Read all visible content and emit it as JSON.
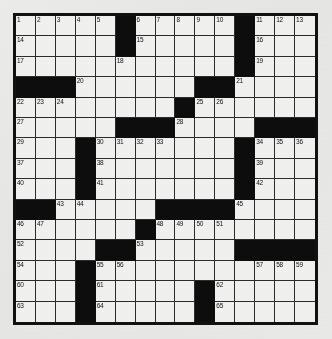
{
  "puzzle": {
    "title": "Crossword Puzzle Grid",
    "grid_size": {
      "rows": 15,
      "cols": 15
    },
    "colors": {
      "block": "#0d0d0d",
      "cell": "#f1f1ef",
      "border": "#111111",
      "page_background": "#e8e8e6",
      "number_text": "#111111"
    },
    "legend": {
      "block_symbol": "#",
      "open_symbol": "."
    },
    "layout_rows": [
      ".....#.....#....",
      ".....#.....#....",
      ".....#.....#....",
      "###...........",
      "........#......",
      ".....###.....###",
      "...#........#...",
      "...#........#...",
      "...#........#...",
      "##.....####....",
      "......#........",
      "....##.......####",
      "...#.........###",
      "...#.....#.....",
      "...#.....#....."
    ],
    "grid": [
      [
        "w",
        "w",
        "w",
        "w",
        "w",
        "b",
        "w",
        "w",
        "w",
        "w",
        "w",
        "b",
        "w",
        "w",
        "w"
      ],
      [
        "w",
        "w",
        "w",
        "w",
        "w",
        "b",
        "w",
        "w",
        "w",
        "w",
        "w",
        "b",
        "w",
        "w",
        "w"
      ],
      [
        "w",
        "w",
        "w",
        "w",
        "w",
        "w",
        "w",
        "w",
        "w",
        "w",
        "w",
        "b",
        "w",
        "w",
        "w"
      ],
      [
        "b",
        "b",
        "b",
        "w",
        "w",
        "w",
        "w",
        "w",
        "w",
        "b",
        "b",
        "w",
        "w",
        "w",
        "w"
      ],
      [
        "w",
        "w",
        "w",
        "w",
        "w",
        "w",
        "w",
        "w",
        "b",
        "w",
        "w",
        "w",
        "w",
        "w",
        "w"
      ],
      [
        "w",
        "w",
        "w",
        "w",
        "w",
        "b",
        "b",
        "b",
        "w",
        "w",
        "w",
        "w",
        "b",
        "b",
        "b"
      ],
      [
        "w",
        "w",
        "w",
        "b",
        "w",
        "w",
        "w",
        "w",
        "w",
        "w",
        "w",
        "b",
        "w",
        "w",
        "w"
      ],
      [
        "w",
        "w",
        "w",
        "b",
        "w",
        "w",
        "w",
        "w",
        "w",
        "w",
        "w",
        "b",
        "w",
        "w",
        "w"
      ],
      [
        "w",
        "w",
        "w",
        "b",
        "w",
        "w",
        "w",
        "w",
        "w",
        "w",
        "w",
        "b",
        "w",
        "w",
        "w"
      ],
      [
        "b",
        "b",
        "w",
        "w",
        "w",
        "w",
        "w",
        "b",
        "b",
        "b",
        "b",
        "w",
        "w",
        "w",
        "w"
      ],
      [
        "w",
        "w",
        "w",
        "w",
        "w",
        "w",
        "b",
        "w",
        "w",
        "w",
        "w",
        "w",
        "w",
        "w",
        "w"
      ],
      [
        "w",
        "w",
        "w",
        "w",
        "b",
        "b",
        "w",
        "w",
        "w",
        "w",
        "w",
        "b",
        "b",
        "b",
        "b"
      ],
      [
        "w",
        "w",
        "w",
        "b",
        "w",
        "w",
        "w",
        "w",
        "w",
        "w",
        "w",
        "w",
        "w",
        "w",
        "w"
      ],
      [
        "w",
        "w",
        "w",
        "b",
        "w",
        "w",
        "w",
        "w",
        "w",
        "b",
        "w",
        "w",
        "w",
        "w",
        "w"
      ],
      [
        "w",
        "w",
        "w",
        "b",
        "w",
        "w",
        "w",
        "w",
        "w",
        "b",
        "w",
        "w",
        "w",
        "w",
        "w"
      ]
    ],
    "numbers": [
      {
        "row": 0,
        "col": 0,
        "n": "1"
      },
      {
        "row": 0,
        "col": 1,
        "n": "2"
      },
      {
        "row": 0,
        "col": 2,
        "n": "3"
      },
      {
        "row": 0,
        "col": 3,
        "n": "4"
      },
      {
        "row": 0,
        "col": 4,
        "n": "5"
      },
      {
        "row": 0,
        "col": 6,
        "n": "6"
      },
      {
        "row": 0,
        "col": 7,
        "n": "7"
      },
      {
        "row": 0,
        "col": 8,
        "n": "8"
      },
      {
        "row": 0,
        "col": 9,
        "n": "9"
      },
      {
        "row": 0,
        "col": 10,
        "n": "10"
      },
      {
        "row": 0,
        "col": 12,
        "n": "11"
      },
      {
        "row": 0,
        "col": 13,
        "n": "12"
      },
      {
        "row": 0,
        "col": 14,
        "n": "13"
      },
      {
        "row": 1,
        "col": 0,
        "n": "14"
      },
      {
        "row": 1,
        "col": 6,
        "n": "15"
      },
      {
        "row": 1,
        "col": 12,
        "n": "16"
      },
      {
        "row": 2,
        "col": 0,
        "n": "17"
      },
      {
        "row": 2,
        "col": 5,
        "n": "18"
      },
      {
        "row": 2,
        "col": 12,
        "n": "19"
      },
      {
        "row": 3,
        "col": 3,
        "n": "20"
      },
      {
        "row": 3,
        "col": 11,
        "n": "21"
      },
      {
        "row": 4,
        "col": 0,
        "n": "22"
      },
      {
        "row": 4,
        "col": 1,
        "n": "23"
      },
      {
        "row": 4,
        "col": 2,
        "n": "24"
      },
      {
        "row": 4,
        "col": 9,
        "n": "25"
      },
      {
        "row": 4,
        "col": 10,
        "n": "26"
      },
      {
        "row": 5,
        "col": 0,
        "n": "27"
      },
      {
        "row": 5,
        "col": 8,
        "n": "28"
      },
      {
        "row": 6,
        "col": 0,
        "n": "29"
      },
      {
        "row": 6,
        "col": 4,
        "n": "30"
      },
      {
        "row": 6,
        "col": 5,
        "n": "31"
      },
      {
        "row": 6,
        "col": 6,
        "n": "32"
      },
      {
        "row": 6,
        "col": 7,
        "n": "33"
      },
      {
        "row": 6,
        "col": 12,
        "n": "34"
      },
      {
        "row": 6,
        "col": 13,
        "n": "35"
      },
      {
        "row": 6,
        "col": 14,
        "n": "36"
      },
      {
        "row": 7,
        "col": 0,
        "n": "37"
      },
      {
        "row": 7,
        "col": 4,
        "n": "38"
      },
      {
        "row": 7,
        "col": 12,
        "n": "39"
      },
      {
        "row": 8,
        "col": 0,
        "n": "40"
      },
      {
        "row": 8,
        "col": 4,
        "n": "41"
      },
      {
        "row": 8,
        "col": 12,
        "n": "42"
      },
      {
        "row": 9,
        "col": 2,
        "n": "43"
      },
      {
        "row": 9,
        "col": 3,
        "n": "44"
      },
      {
        "row": 9,
        "col": 11,
        "n": "45"
      },
      {
        "row": 10,
        "col": 0,
        "n": "46"
      },
      {
        "row": 10,
        "col": 1,
        "n": "47"
      },
      {
        "row": 10,
        "col": 7,
        "n": "48"
      },
      {
        "row": 10,
        "col": 8,
        "n": "49"
      },
      {
        "row": 10,
        "col": 9,
        "n": "50"
      },
      {
        "row": 10,
        "col": 10,
        "n": "51"
      },
      {
        "row": 11,
        "col": 0,
        "n": "52"
      },
      {
        "row": 11,
        "col": 6,
        "n": "53"
      },
      {
        "row": 12,
        "col": 0,
        "n": "54"
      },
      {
        "row": 12,
        "col": 4,
        "n": "55"
      },
      {
        "row": 12,
        "col": 5,
        "n": "56"
      },
      {
        "row": 12,
        "col": 12,
        "n": "57"
      },
      {
        "row": 12,
        "col": 13,
        "n": "58"
      },
      {
        "row": 12,
        "col": 14,
        "n": "59"
      },
      {
        "row": 13,
        "col": 0,
        "n": "60"
      },
      {
        "row": 13,
        "col": 4,
        "n": "61"
      },
      {
        "row": 13,
        "col": 10,
        "n": "62"
      },
      {
        "row": 14,
        "col": 0,
        "n": "63"
      },
      {
        "row": 14,
        "col": 4,
        "n": "64"
      },
      {
        "row": 14,
        "col": 10,
        "n": "65"
      }
    ],
    "entered_letters": []
  }
}
